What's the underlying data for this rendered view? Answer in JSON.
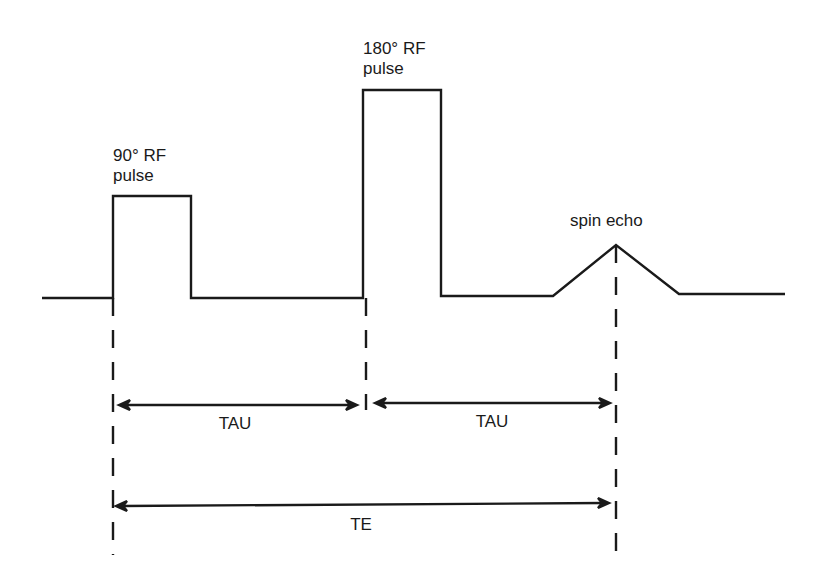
{
  "diagram": {
    "colors": {
      "line": "#1a1a1a",
      "background": "#ffffff"
    },
    "labels": {
      "pulse90_line1": "90° RF",
      "pulse90_line2": "pulse",
      "pulse180_line1": "180° RF",
      "pulse180_line2": "pulse",
      "spin_echo": "spin echo",
      "tau1": "TAU",
      "tau2": "TAU",
      "te": "TE"
    }
  }
}
